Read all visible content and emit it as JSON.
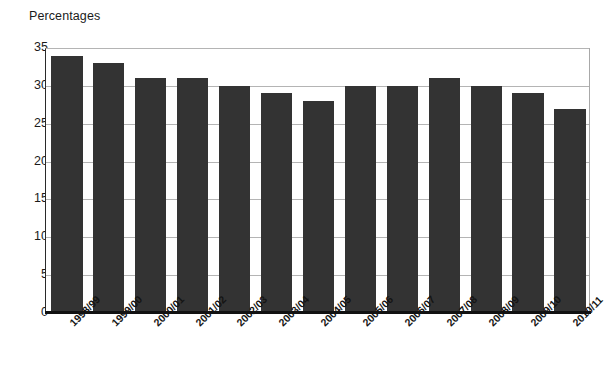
{
  "chart_data": {
    "type": "bar",
    "title": "Percentages",
    "xlabel": "",
    "ylabel": "",
    "ylim": [
      0,
      35
    ],
    "ytick_step": 5,
    "yticks": [
      0,
      5,
      10,
      15,
      20,
      25,
      30,
      35
    ],
    "grid": true,
    "legend": false,
    "legend_position": "none",
    "bar_color": "#333333",
    "gridline_color": "#b4b4b4",
    "axis_color": "#111111",
    "categories": [
      "1998/99",
      "1999/00",
      "2000/01",
      "2001/02",
      "2002/03",
      "2003/04",
      "2004/05",
      "2005/06",
      "2006/07",
      "2007/08",
      "2008/09",
      "2009/10",
      "2010/11"
    ],
    "values": [
      34,
      33,
      31,
      31,
      30,
      29,
      28,
      30,
      30,
      31,
      30,
      29,
      27
    ]
  }
}
